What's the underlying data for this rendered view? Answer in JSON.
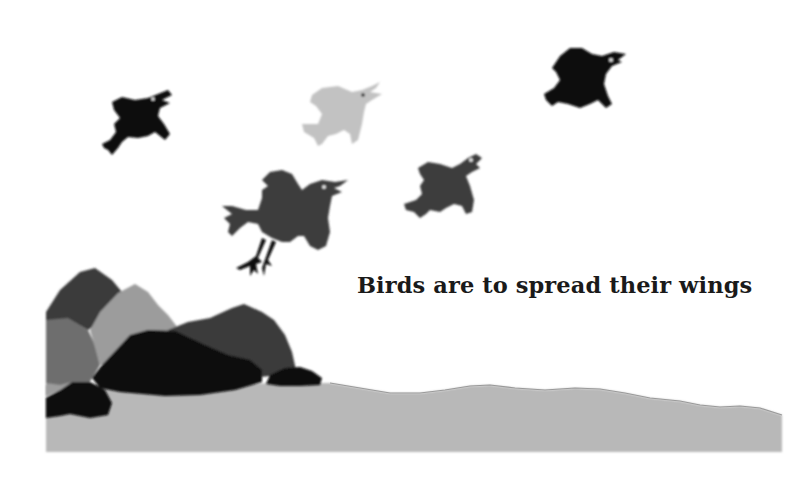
{
  "caption": "Birds are to spread their wings",
  "scene": {
    "description": "Paper-cut style illustration of five crows flying over grey rocks and a grey ground strip",
    "colors": {
      "background": "#ffffff",
      "ground": "#b8b8b8",
      "ground_edge": "#9a9a9a",
      "rock_black": "#0c0c0c",
      "rock_dark": "#3a3a3a",
      "rock_mid": "#6e6e6e",
      "rock_light": "#9c9c9c",
      "bird_black": "#0d0d0d",
      "bird_dark": "#3c3c3c",
      "bird_light": "#c2c2c2",
      "eye": "#ffffff"
    },
    "birds": [
      {
        "name": "bird-black-left",
        "shade": "bird_black"
      },
      {
        "name": "bird-light-center",
        "shade": "bird_light"
      },
      {
        "name": "bird-black-right",
        "shade": "bird_black"
      },
      {
        "name": "bird-dark-large",
        "shade": "bird_dark"
      },
      {
        "name": "bird-dark-small",
        "shade": "bird_dark"
      }
    ]
  }
}
